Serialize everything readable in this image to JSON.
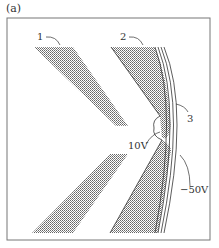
{
  "figure": {
    "panel_label": "(a)",
    "labels": {
      "electrode_1": "1",
      "electrode_2": "2",
      "layer_3": "3",
      "voltage_tip": "10V",
      "voltage_layer": "−50V"
    },
    "colors": {
      "stroke": "#333333",
      "hatch": "#555555",
      "frame": "#666666",
      "background": "#ffffff"
    }
  }
}
